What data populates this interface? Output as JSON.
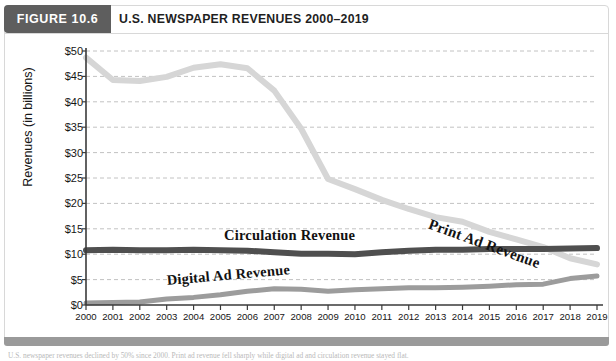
{
  "figure": {
    "badge": "FIGURE 10.6",
    "title": "U.S. NEWSPAPER REVENUES 2000–2019",
    "caption_sliver": "U.S. newspaper revenues declined by 50% since 2000. Print ad revenue fell sharply while digital ad and circulation revenue stayed flat."
  },
  "colors": {
    "badge_bg": "#5e5e5e",
    "title_text": "#1f1f1f",
    "print_ad": "#d6d6d6",
    "circulation": "#4f4f4f",
    "digital_ad": "#9c9c9c",
    "axis": "#3a3a3a",
    "gridline": "#c2c2c2",
    "footer_bar": "#9a9a9a"
  },
  "chart_data": {
    "type": "line",
    "title": "U.S. NEWSPAPER REVENUES 2000–2019",
    "xlabel": "",
    "ylabel": "Revenues (in billions)",
    "ylim": [
      0,
      50
    ],
    "ytick_labels": [
      "$0",
      "$5",
      "$10",
      "$15",
      "$20",
      "$25",
      "$30",
      "$35",
      "$40",
      "$45",
      "$50"
    ],
    "ytick_values": [
      0,
      5,
      10,
      15,
      20,
      25,
      30,
      35,
      40,
      45,
      50
    ],
    "grid": "horizontal-dashed",
    "legend": "inline-labels",
    "categories": [
      "2000",
      "2001",
      "2002",
      "2003",
      "2004",
      "2005",
      "2006",
      "2007",
      "2008",
      "2009",
      "2010",
      "2011",
      "2012",
      "2013",
      "2014",
      "2015",
      "2016",
      "2017",
      "2018",
      "2019"
    ],
    "series": [
      {
        "name": "Print Ad Revenue",
        "color": "#d6d6d6",
        "values": [
          48.7,
          44.3,
          44.1,
          44.9,
          46.7,
          47.4,
          46.6,
          42.2,
          34.7,
          24.8,
          22.8,
          20.7,
          18.9,
          17.3,
          16.4,
          14.4,
          12.9,
          11.4,
          9.2,
          8.0
        ]
      },
      {
        "name": "Circulation Revenue",
        "color": "#4f4f4f",
        "values": [
          10.8,
          10.9,
          10.8,
          10.8,
          10.9,
          10.8,
          10.7,
          10.4,
          10.1,
          10.1,
          10.0,
          10.4,
          10.7,
          10.9,
          10.9,
          11.0,
          11.0,
          11.0,
          11.1,
          11.2
        ]
      },
      {
        "name": "Digital Ad Revenue",
        "color": "#9c9c9c",
        "values": [
          0.4,
          0.5,
          0.6,
          1.2,
          1.5,
          2.0,
          2.7,
          3.2,
          3.1,
          2.7,
          3.0,
          3.2,
          3.4,
          3.4,
          3.5,
          3.7,
          4.0,
          4.1,
          5.2,
          5.7
        ]
      }
    ]
  }
}
